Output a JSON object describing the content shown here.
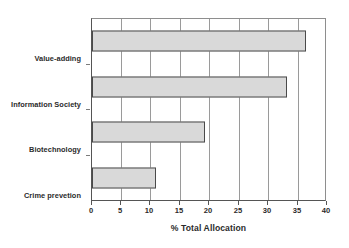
{
  "chart_data": {
    "type": "bar",
    "orientation": "horizontal",
    "title": "",
    "xlabel": "% Total Allocation",
    "ylabel": "",
    "categories": [
      "Value-adding",
      "Information Society",
      "Biotechnology",
      "Crime prevetion"
    ],
    "values": [
      36.7,
      33.4,
      19.4,
      11.0
    ],
    "xlim": [
      0,
      40
    ],
    "xticks": [
      0,
      5,
      10,
      15,
      20,
      25,
      30,
      35,
      40
    ],
    "xtick_labels": [
      "0",
      "5",
      "10",
      "15",
      "20",
      "25",
      "30",
      "35",
      "40"
    ],
    "grid": "vertical",
    "legend": "none",
    "bar_fill_color": "#d9d9d9",
    "bar_border_color": "#4a4a4a",
    "axis_color": "#555555",
    "gridline_color": "#9a9a9a",
    "background_color": "#ffffff",
    "text_color": "#2b2b2b"
  }
}
